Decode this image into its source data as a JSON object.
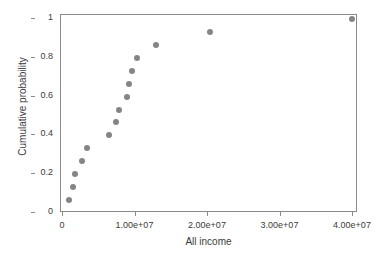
{
  "chart_data": {
    "type": "scatter",
    "title": "",
    "xlabel": "All income",
    "ylabel": "Cumulative probability",
    "xlim": [
      -1200000,
      41900000
    ],
    "ylim": [
      -0.03,
      1.03
    ],
    "grid": false,
    "legend": false,
    "marker": {
      "shape": "circle",
      "color": "#858585",
      "size_px": 6
    },
    "xticks": [
      0,
      10000000,
      20000000,
      30000000,
      40000000
    ],
    "xtick_labels": [
      "0",
      "1.00e+07",
      "2.00e+07",
      "3.00e+07",
      "4.00e+07"
    ],
    "yticks": [
      0,
      0.2,
      0.4,
      0.6,
      0.8,
      1
    ],
    "ytick_labels": [
      "0",
      "0.2",
      "0.4",
      "0.6",
      "0.8",
      "1"
    ],
    "x": [
      800000,
      1400000,
      1700000,
      2600000,
      3300000,
      6300000,
      7300000,
      7700000,
      8800000,
      9100000,
      9500000,
      10200000,
      12800000,
      20300000,
      39900000
    ],
    "y": [
      0.067,
      0.133,
      0.2,
      0.267,
      0.333,
      0.4,
      0.467,
      0.533,
      0.6,
      0.667,
      0.733,
      0.8,
      0.867,
      0.933,
      1.0
    ],
    "points": [
      {
        "x": 800000,
        "y": 0.067
      },
      {
        "x": 1400000,
        "y": 0.133
      },
      {
        "x": 1700000,
        "y": 0.2
      },
      {
        "x": 2600000,
        "y": 0.267
      },
      {
        "x": 3300000,
        "y": 0.333
      },
      {
        "x": 6300000,
        "y": 0.4
      },
      {
        "x": 7300000,
        "y": 0.467
      },
      {
        "x": 7700000,
        "y": 0.533
      },
      {
        "x": 8800000,
        "y": 0.6
      },
      {
        "x": 9100000,
        "y": 0.667
      },
      {
        "x": 9500000,
        "y": 0.733
      },
      {
        "x": 10200000,
        "y": 0.8
      },
      {
        "x": 12800000,
        "y": 0.867
      },
      {
        "x": 20300000,
        "y": 0.933
      },
      {
        "x": 39900000,
        "y": 1.0
      }
    ],
    "n_points": 15,
    "colors": {
      "marker": "#858585",
      "axis": "#8a8a8a",
      "text": "#3b3b3b",
      "background": "#ffffff"
    }
  }
}
